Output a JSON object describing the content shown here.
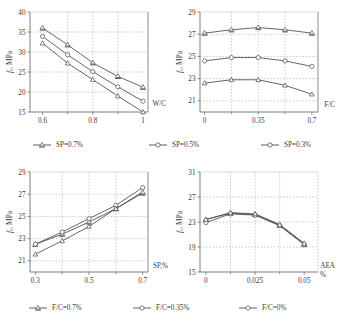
{
  "figure": {
    "title": "",
    "panel_count": 4
  },
  "chart_data": [
    {
      "id": "chart-wc",
      "type": "line",
      "position": "top-left",
      "title": "",
      "xlabel": "W/C",
      "ylabel": "f_c, MPa",
      "ylabel_plain": "fc, MPa",
      "xlim": [
        0.55,
        1.02
      ],
      "ylim": [
        15,
        40
      ],
      "xticks": [
        0.6,
        0.8,
        1
      ],
      "xticklabels": [
        "0.6",
        "0.8",
        "1"
      ],
      "yticks": [
        15,
        20,
        25,
        30,
        35,
        40
      ],
      "yticklabels": [
        "15",
        "20",
        "25",
        "30",
        "35",
        "40"
      ],
      "grid": true,
      "legend_position": "below",
      "x": [
        0.6,
        0.7,
        0.8,
        0.9,
        1.0
      ],
      "series": [
        {
          "name": "SP=0.7%",
          "marker": "triangle-bar",
          "values": [
            36.0,
            31.8,
            27.3,
            23.9,
            21.2
          ]
        },
        {
          "name": "SP=0.5%",
          "marker": "circle",
          "values": [
            33.9,
            29.3,
            25.1,
            21.3,
            17.7
          ]
        },
        {
          "name": "SP=0.3%",
          "marker": "triangle",
          "values": [
            32.2,
            27.2,
            23.1,
            19.0,
            15.0
          ]
        }
      ]
    },
    {
      "id": "chart-fc",
      "type": "line",
      "position": "top-right",
      "title": "",
      "xlabel": "F/C",
      "ylabel": "f_c, MPa",
      "ylabel_plain": "fc, MPa",
      "xlim": [
        -0.03,
        0.74
      ],
      "ylim": [
        20.0,
        29.0
      ],
      "xticks": [
        0,
        0.35,
        0.7
      ],
      "xticklabels": [
        "0",
        "0.35",
        "0.7"
      ],
      "yticks": [
        21,
        23,
        25,
        27,
        29
      ],
      "yticklabels": [
        "21",
        "23",
        "25",
        "27",
        "29"
      ],
      "grid": true,
      "legend_position": "below",
      "x": [
        0,
        0.175,
        0.35,
        0.525,
        0.7
      ],
      "series": [
        {
          "name": "SP=0.7%",
          "marker": "triangle-bar",
          "values": [
            27.1,
            27.4,
            27.6,
            27.4,
            27.1
          ]
        },
        {
          "name": "SP=0.5%",
          "marker": "circle",
          "values": [
            24.6,
            24.9,
            24.9,
            24.6,
            24.1
          ]
        },
        {
          "name": "SP=0.3%",
          "marker": "triangle",
          "values": [
            22.6,
            22.9,
            22.9,
            22.4,
            21.6
          ]
        }
      ]
    },
    {
      "id": "chart-sp",
      "type": "line",
      "position": "bottom-left",
      "title": "",
      "xlabel": "SP,%",
      "ylabel": "f_c, MPa",
      "ylabel_plain": "fc, MPa",
      "xlim": [
        0.28,
        0.72
      ],
      "ylim": [
        20.0,
        29.0
      ],
      "xticks": [
        0.3,
        0.5,
        0.7
      ],
      "xticklabels": [
        "0.3",
        "0.5",
        "0.7"
      ],
      "yticks": [
        21,
        23,
        25,
        27,
        29
      ],
      "yticklabels": [
        "21",
        "23",
        "25",
        "27",
        "29"
      ],
      "grid": true,
      "legend_position": "below",
      "x": [
        0.3,
        0.4,
        0.5,
        0.6,
        0.7
      ],
      "series": [
        {
          "name": "F/C=0.7%",
          "marker": "triangle-bar",
          "values": [
            22.5,
            23.4,
            24.5,
            25.7,
            27.1
          ]
        },
        {
          "name": "F/C=0.35%",
          "marker": "circle",
          "values": [
            22.5,
            23.6,
            24.8,
            26.0,
            27.6
          ]
        },
        {
          "name": "F/C=0%",
          "marker": "triangle",
          "values": [
            21.6,
            22.8,
            24.1,
            25.7,
            27.2
          ]
        }
      ]
    },
    {
      "id": "chart-aea",
      "type": "line",
      "position": "bottom-right",
      "title": "",
      "xlabel": "AEA",
      "xlabel_unit": "%",
      "ylabel": "f_c, MPa",
      "ylabel_plain": "fc, MPa",
      "xlim": [
        -0.003,
        0.057
      ],
      "ylim": [
        15,
        31
      ],
      "xticks": [
        0,
        0.025,
        0.05
      ],
      "xticklabels": [
        "0",
        "0.025",
        "0.05"
      ],
      "yticks": [
        15,
        19,
        23,
        27,
        31
      ],
      "yticklabels": [
        "15",
        "19",
        "23",
        "27",
        "31"
      ],
      "grid": true,
      "legend_position": "below",
      "x": [
        0,
        0.0125,
        0.025,
        0.0375,
        0.05
      ],
      "series": [
        {
          "name": "F/C=0.7%",
          "marker": "triangle-bar",
          "values": [
            23.4,
            24.4,
            24.2,
            22.5,
            19.4
          ]
        },
        {
          "name": "F/C=0.35%",
          "marker": "circle",
          "values": [
            22.9,
            24.3,
            24.1,
            22.4,
            19.4
          ]
        },
        {
          "name": "F/C=0%",
          "marker": "triangle",
          "values": [
            23.4,
            24.5,
            24.3,
            22.6,
            19.6
          ]
        }
      ]
    }
  ],
  "legends": [
    {
      "id": "legend-top",
      "items": [
        {
          "label": "SP=0.7%",
          "marker": "triangle-bar"
        },
        {
          "label": "SP=0.5%",
          "marker": "circle"
        },
        {
          "label": "SP=0.3%",
          "marker": "circle"
        }
      ]
    },
    {
      "id": "legend-bottom",
      "items": [
        {
          "label": "F/C=0.7%",
          "marker": "triangle-bar"
        },
        {
          "label": "F/C=0.35%",
          "marker": "circle"
        },
        {
          "label": "F/C=0%",
          "marker": "circle"
        }
      ]
    }
  ],
  "style": {
    "line_color": "#4a4a4a",
    "grid_color": "#9a9a9a",
    "axis_color": "#6f6f6f",
    "text_color": "#3a3a3a",
    "background": "#ffffff"
  }
}
